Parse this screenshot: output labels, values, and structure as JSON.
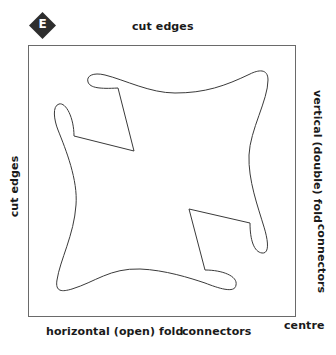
{
  "badge": {
    "letter": "E",
    "fill": "#2e2e2e",
    "text_color": "#ffffff"
  },
  "labels": {
    "top": "cut edges",
    "left": "cut edges",
    "right_upper": "vertical (double) fold",
    "right_lower": "connectors",
    "bottom_left": "horizontal (open) fold",
    "bottom_middle": "connectors",
    "corner": "centre"
  },
  "colors": {
    "frame": "#6a6a6a",
    "outline": "#3a3a3a",
    "text": "#1a1a1a"
  }
}
